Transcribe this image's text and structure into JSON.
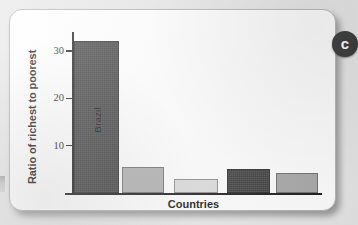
{
  "figure": {
    "badge_letter": "c"
  },
  "chart_data": {
    "type": "bar",
    "title": "",
    "xlabel": "Countries",
    "ylabel": "Ratio of richest to poorest",
    "categories": [
      "Brazil",
      "",
      "",
      "",
      ""
    ],
    "values": [
      32,
      5.5,
      3,
      5,
      4.3
    ],
    "bar_labels": [
      "Brazil",
      "",
      "",
      "",
      ""
    ],
    "bar_colors": [
      "#3b3b3b",
      "#b1b1b1",
      "#dcdcdc",
      "#3b3b3b",
      "#a8a8a8"
    ],
    "ylim": [
      0,
      34
    ],
    "yticks": [
      10,
      20,
      30
    ],
    "ytick_labels": [
      "10",
      "20",
      "30"
    ],
    "xticks": [],
    "xtick_labels": [],
    "grid": false,
    "legend": null
  }
}
